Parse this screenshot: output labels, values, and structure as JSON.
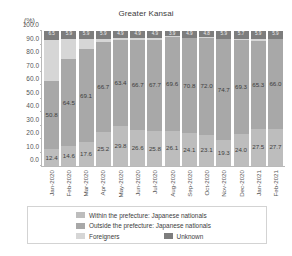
{
  "chart": {
    "title": "Greater Kansai",
    "unit_label": "(%)",
    "type": "bar"
  },
  "legend": {
    "items": [
      {
        "label": "Within the prefecture: Japanese nationals",
        "color": "#bdbdbd",
        "key": "within"
      },
      {
        "label": "Outside the prefecture: Japanese nationals",
        "color": "#a8a8a8",
        "key": "outside"
      },
      {
        "label": "Foreigners",
        "color": "#d6d6d6",
        "key": "foreigners"
      },
      {
        "label": "Unknown",
        "color": "#7d7d7d",
        "key": "unknown"
      }
    ]
  },
  "chart_data": {
    "type": "bar",
    "stacked": true,
    "stack_total": 100,
    "title": "Greater Kansai",
    "xlabel": "",
    "ylabel": "(%)",
    "ylim": [
      0,
      100
    ],
    "yticks": [
      "0.0",
      "10.0",
      "20.0",
      "30.0",
      "40.0",
      "50.0",
      "60.0",
      "70.0",
      "80.0",
      "90.0",
      "100.0"
    ],
    "grid": false,
    "legend_position": "bottom",
    "categories": [
      "Jan-2020",
      "Feb-2020",
      "Mar-2020",
      "Apr-2020",
      "May-2020",
      "Jun-2020",
      "Jul-2020",
      "Aug-2020",
      "Sep-2020",
      "Oct-2020",
      "Nov-2020",
      "Dec-2020",
      "Jan-2021",
      "Feb-2021"
    ],
    "series": [
      {
        "name": "Within the prefecture: Japanese nationals",
        "color": "#bdbdbd",
        "values": [
          12.4,
          14.6,
          17.6,
          25.2,
          29.8,
          26.6,
          25.8,
          26.1,
          24.1,
          23.1,
          19.3,
          24.0,
          27.5,
          27.7
        ]
      },
      {
        "name": "Outside the prefecture: Japanese nationals",
        "color": "#a8a8a8",
        "values": [
          50.8,
          64.5,
          69.1,
          66.7,
          63.4,
          66.7,
          67.7,
          69.6,
          70.8,
          72.0,
          74.7,
          69.3,
          65.3,
          66.0
        ]
      },
      {
        "name": "Foreigners",
        "color": "#d6d6d6",
        "values": [
          30.3,
          15.0,
          7.4,
          2.2,
          1.9,
          1.8,
          1.6,
          0.4,
          0.2,
          0.1,
          0.1,
          1.0,
          1.3,
          0.4
        ]
      },
      {
        "name": "Unknown",
        "color": "#7d7d7d",
        "values": [
          6.5,
          5.9,
          5.9,
          5.9,
          4.9,
          4.9,
          4.9,
          3.9,
          4.9,
          4.8,
          5.9,
          5.7,
          5.9,
          5.9
        ]
      }
    ],
    "bar_labels": {
      "within": [
        "12.4",
        "14.6",
        "17.6",
        "25.2",
        "29.8",
        "26.6",
        "25.8",
        "26.1",
        "24.1",
        "23.1",
        "19.3",
        "24.0",
        "27.5",
        "27.7"
      ],
      "outside": [
        "50.8",
        "64.5",
        "69.1",
        "66.7",
        "63.4",
        "66.7",
        "67.7",
        "69.6",
        "70.8",
        "72.0",
        "74.7",
        "69.3",
        "65.3",
        "66.0"
      ],
      "unknown": [
        "6.5",
        "5.9",
        "5.9",
        "5.9",
        "4.9",
        "4.9",
        "4.9",
        "3.9",
        "4.9",
        "4.8",
        "5.9",
        "5.7",
        "5.9",
        "5.9"
      ]
    }
  }
}
